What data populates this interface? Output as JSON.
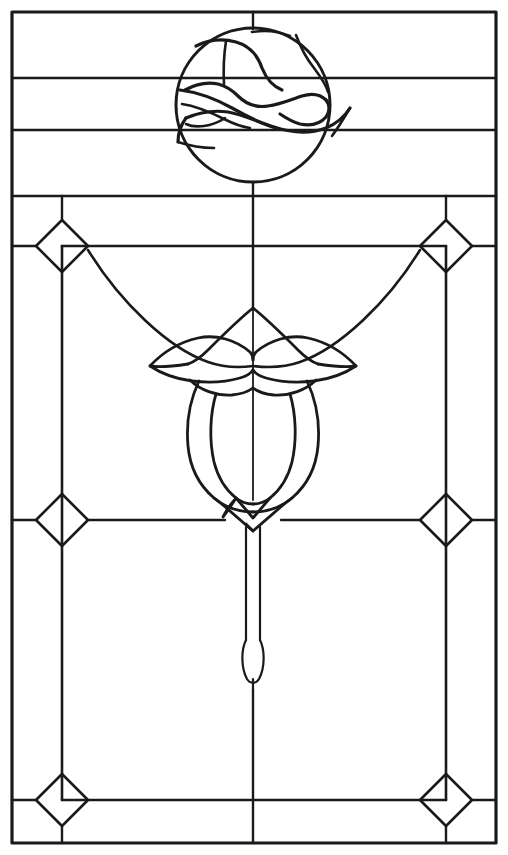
{
  "document": {
    "title": "Stained Glass Window Pattern — Dove and Tulip",
    "medium": "line drawing / leaded glass cartoon",
    "orientation": "portrait",
    "canvas": {
      "width": 508,
      "height": 855,
      "background": "#ffffff"
    },
    "line_color": "#1a1a1a"
  },
  "regions": [
    {
      "name": "upper-transom-panel",
      "label": "Upper transom panel with dove roundel"
    },
    {
      "name": "main-panel",
      "label": "Main panel with tulip swag and border"
    }
  ],
  "elements": {
    "outer_frame": {
      "label": "Outer frame",
      "x": 12,
      "y": 12,
      "width": 484,
      "height": 831
    },
    "transom_divider": {
      "label": "Transom divider rail",
      "y": 196
    },
    "transom_rails": {
      "label": "Transom horizontal rails",
      "y_values": [
        78,
        130
      ]
    },
    "center_mullion": {
      "label": "Vertical centre line",
      "x": 253
    },
    "dove_roundel": {
      "label": "Dove roundel",
      "center_x": 253,
      "center_y": 105,
      "radius": 77,
      "motif": "flying-dove"
    },
    "border_band": {
      "label": "Inner border band",
      "inset": 50,
      "inner_frame": {
        "x": 62,
        "y": 246,
        "width": 384,
        "height": 547
      }
    },
    "border_diamonds": {
      "label": "Border diamonds",
      "half_size": 26,
      "positions": [
        {
          "name": "diamond-top-left",
          "x": 62,
          "y": 246
        },
        {
          "name": "diamond-top-right",
          "x": 446,
          "y": 246
        },
        {
          "name": "diamond-mid-left",
          "x": 62,
          "y": 520
        },
        {
          "name": "diamond-mid-right",
          "x": 446,
          "y": 520
        },
        {
          "name": "diamond-bottom-left",
          "x": 62,
          "y": 800
        },
        {
          "name": "diamond-bottom-right",
          "x": 446,
          "y": 800
        }
      ]
    },
    "swag": {
      "label": "Draped swag garland",
      "left_anchor": {
        "x": 88,
        "y": 250
      },
      "right_anchor": {
        "x": 420,
        "y": 250
      },
      "low_point_y": 368
    },
    "tulip": {
      "label": "Central tulip blossom",
      "apex": {
        "x": 253,
        "y": 308
      },
      "petal_tips_y": 378,
      "bowl_bottom_y": 500,
      "width": 120
    },
    "stem": {
      "label": "Tulip stem",
      "top_y": 500,
      "bottom_y": 690,
      "bud_center_y": 660,
      "bud_height": 46,
      "bud_width": 20
    }
  },
  "geometry_notes": {
    "symmetry": "bilateral about x = 253",
    "panel_count_description": "transom with three rails, roundel; main light with bordered field, swag and tulip"
  }
}
